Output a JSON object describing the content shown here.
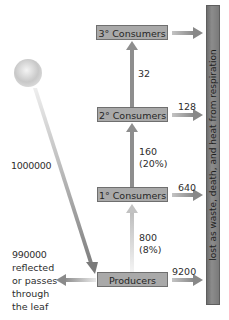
{
  "diagram": {
    "type": "energy flow pyramid",
    "levels": [
      {
        "name": "3° Consumers",
        "lost": ""
      },
      {
        "name": "2° Consumers",
        "lost": "128"
      },
      {
        "name": "1° Consumers",
        "lost": "640"
      },
      {
        "name": "Producers",
        "lost": "9200"
      }
    ],
    "transfers": [
      {
        "from": "Producers",
        "to": "1° Consumers",
        "value": "800",
        "percent": "(8%)"
      },
      {
        "from": "1° Consumers",
        "to": "2° Consumers",
        "value": "160",
        "percent": "(20%)"
      },
      {
        "from": "2° Consumers",
        "to": "3° Consumers",
        "value": "32",
        "percent": ""
      }
    ],
    "sunlight": {
      "value": "1000000"
    },
    "reflected": {
      "value": "990000",
      "text": "reflected or passes through the leaf"
    },
    "loss_bar": {
      "text": "lost as waste, death, and heat from respiration"
    },
    "colors": {
      "box_fill": "#a9a9a9",
      "bar_fill": "#808080",
      "arrow": "#8c8c8c"
    }
  }
}
